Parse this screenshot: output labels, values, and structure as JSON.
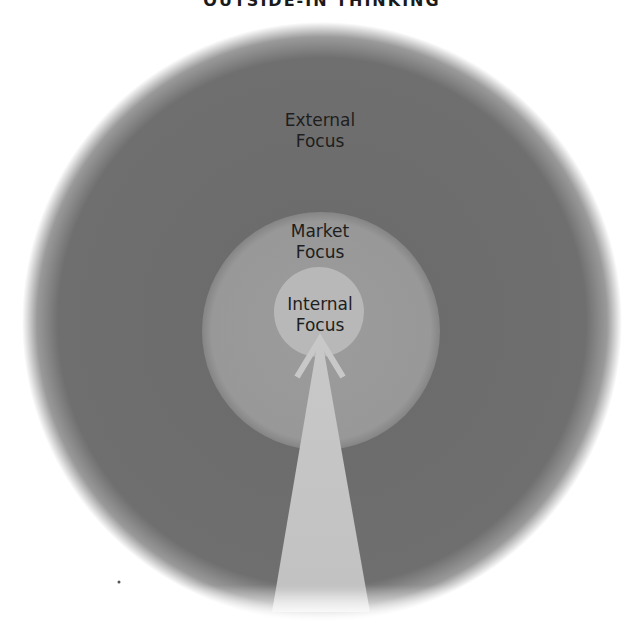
{
  "title": "OUTSIDE-IN THINKING",
  "rings": [
    {
      "name": "external",
      "line1": "External",
      "line2": "Focus",
      "color": "#6e6e6e"
    },
    {
      "name": "market",
      "line1": "Market",
      "line2": "Focus",
      "color": "#9a9a9a"
    },
    {
      "name": "internal",
      "line1": "Internal",
      "line2": "Focus",
      "color": "#b9b9b9"
    }
  ],
  "arrow": {
    "direction": "up",
    "color": "#c4c4c4"
  }
}
